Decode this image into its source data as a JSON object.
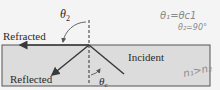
{
  "diagram": {
    "type": "optics-total-internal-reflection",
    "labels": {
      "refracted": "Refracted",
      "reflected": "Reflected",
      "incident": "Incident",
      "theta2": "θ",
      "theta2_sub": "2",
      "thetac": "θ",
      "thetac_sub": "c"
    },
    "annotations": {
      "line1": "θ₁=θc1",
      "line2": "θ₂=90°",
      "line3": "n₁>n₂"
    },
    "colors": {
      "medium_fill": "#dcdcdc",
      "medium_border": "#555555",
      "ray": "#3a3a3a",
      "background": "#f4f4f4",
      "handwriting": "#8a8a8a"
    }
  }
}
